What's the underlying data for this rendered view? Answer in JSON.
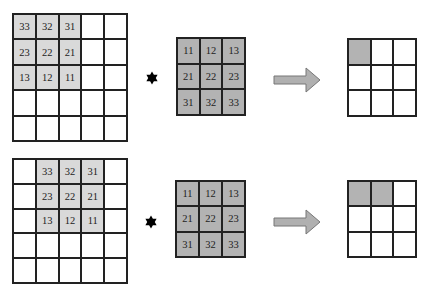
{
  "colors": {
    "border": "#222222",
    "input_highlight": "#d9d9d9",
    "kernel_fill": "#b3b3b3",
    "output_fill": "#b3b3b3",
    "arrow_fill": "#b0b0b0",
    "arrow_stroke": "#777777",
    "star": "#000000"
  },
  "rows": [
    {
      "input": {
        "size": 5,
        "cells": [
          [
            "33",
            "32",
            "31",
            "",
            ""
          ],
          [
            "23",
            "22",
            "21",
            "",
            ""
          ],
          [
            "13",
            "12",
            "11",
            "",
            ""
          ],
          [
            "",
            "",
            "",
            "",
            ""
          ],
          [
            "",
            "",
            "",
            "",
            ""
          ]
        ],
        "highlight": [
          [
            0,
            0
          ],
          [
            0,
            1
          ],
          [
            0,
            2
          ],
          [
            1,
            0
          ],
          [
            1,
            1
          ],
          [
            1,
            2
          ],
          [
            2,
            0
          ],
          [
            2,
            1
          ],
          [
            2,
            2
          ]
        ]
      },
      "operator": "convolution-star",
      "kernel": {
        "cells": [
          [
            "11",
            "12",
            "13"
          ],
          [
            "21",
            "22",
            "23"
          ],
          [
            "31",
            "32",
            "33"
          ]
        ]
      },
      "output": {
        "size": 3,
        "filled": [
          [
            0,
            0
          ]
        ]
      }
    },
    {
      "input": {
        "size": 5,
        "cells": [
          [
            "",
            "33",
            "32",
            "31",
            ""
          ],
          [
            "",
            "23",
            "22",
            "21",
            ""
          ],
          [
            "",
            "13",
            "12",
            "11",
            ""
          ],
          [
            "",
            "",
            "",
            "",
            ""
          ],
          [
            "",
            "",
            "",
            "",
            ""
          ]
        ],
        "highlight": [
          [
            0,
            1
          ],
          [
            0,
            2
          ],
          [
            0,
            3
          ],
          [
            1,
            1
          ],
          [
            1,
            2
          ],
          [
            1,
            3
          ],
          [
            2,
            1
          ],
          [
            2,
            2
          ],
          [
            2,
            3
          ]
        ]
      },
      "operator": "convolution-star",
      "kernel": {
        "cells": [
          [
            "11",
            "12",
            "13"
          ],
          [
            "21",
            "22",
            "23"
          ],
          [
            "31",
            "32",
            "33"
          ]
        ]
      },
      "output": {
        "size": 3,
        "filled": [
          [
            0,
            0
          ],
          [
            0,
            1
          ]
        ]
      }
    }
  ]
}
